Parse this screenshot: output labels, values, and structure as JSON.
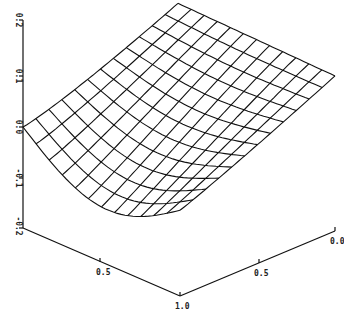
{
  "chart_data": {
    "type": "surface",
    "title": "",
    "z_axis": {
      "label": "",
      "range": [
        -0.2,
        0.2
      ],
      "ticks": [
        "0.2",
        "0.1",
        "0.0",
        "-0.1",
        "-0.2"
      ]
    },
    "x_axis": {
      "label": "",
      "range": [
        0.0,
        1.0
      ],
      "ticks": [
        "0.5",
        "1.0"
      ]
    },
    "y_axis": {
      "label": "",
      "range": [
        0.0,
        1.0
      ],
      "ticks": [
        "0.0",
        "0.5"
      ]
    },
    "grid": {
      "rows": 12,
      "cols": 12
    },
    "corner_values": {
      "x0_y0": 0.0,
      "x0_y1": 0.1,
      "x1_y0": -0.05,
      "x1_y1": 0.0
    },
    "line_color": "#111111",
    "background": "#ffffff"
  },
  "labels": {
    "z_0_2": "0.2",
    "z_0_1": "0.1",
    "z_0_0": "0.0",
    "z_m0_1": "-0.1",
    "z_m0_2": "-0.2",
    "x_0_5": "0.5",
    "x_1_0": "1.0",
    "y_0_5": "0.5",
    "y_0_0": "0.0"
  }
}
